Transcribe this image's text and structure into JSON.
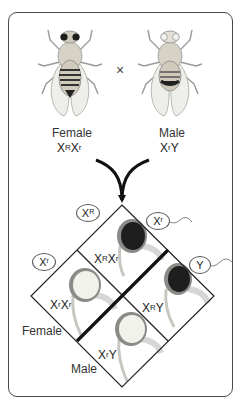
{
  "parents": {
    "female": {
      "label": "Female",
      "genotype_base1": "X",
      "genotype_sup1": "R",
      "genotype_base2": "X",
      "genotype_sup2": "r",
      "eye_color": "red"
    },
    "male": {
      "label": "Male",
      "genotype_base1": "X",
      "genotype_sup1": "r",
      "genotype_base2": "Y",
      "eye_color": "white"
    },
    "cross_symbol": "×"
  },
  "punnett": {
    "female_gametes": [
      {
        "base": "X",
        "sup": "R"
      },
      {
        "base": "X",
        "sup": "r"
      }
    ],
    "male_gametes": [
      {
        "base": "X",
        "sup": "r"
      },
      {
        "base": "Y",
        "sup": ""
      }
    ],
    "axis_labels": {
      "female": "Female",
      "male": "Male"
    },
    "offspring": [
      {
        "position": "top",
        "g1": "X",
        "s1": "R",
        "g2": "X",
        "s2": "r",
        "eye": "red"
      },
      {
        "position": "left",
        "g1": "X",
        "s1": "r",
        "g2": "X",
        "s2": "r",
        "eye": "white"
      },
      {
        "position": "right",
        "g1": "X",
        "s1": "R",
        "g2": "Y",
        "s2": "",
        "eye": "red"
      },
      {
        "position": "bottom",
        "g1": "X",
        "s1": "r",
        "g2": "Y",
        "s2": "",
        "eye": "white"
      }
    ]
  },
  "colors": {
    "red_eye": "#1e1e1e",
    "white_eye": "#f2f2ec",
    "eye_ring": "#7a7a7a",
    "line": "#222222"
  }
}
